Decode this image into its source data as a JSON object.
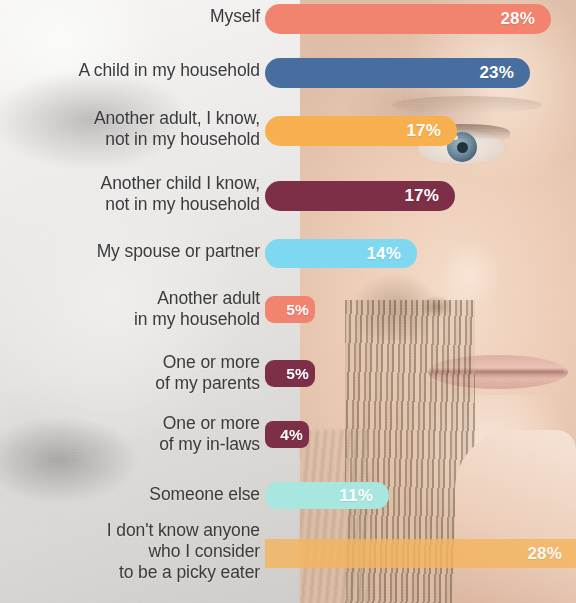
{
  "colors": {
    "coral": "#F2836E",
    "steel_blue": "#476E9E",
    "amber": "#F8B04E",
    "maroon": "#7D2F48",
    "sky_blue": "#7DD8F0",
    "mint": "#A8E6E0",
    "amber_translucent": "#F5B55E",
    "label_text": "#3A3A3C",
    "value_text": "#FFFFFF"
  },
  "chart_data": {
    "type": "bar",
    "orientation": "horizontal",
    "title": "",
    "xlabel": "",
    "ylabel": "",
    "xlim": [
      0,
      30
    ],
    "grid": false,
    "legend": false,
    "value_suffix": "%",
    "categories": [
      "Myself",
      "A child in my household",
      "Another adult, I know,\nnot in my household",
      "Another child I know,\nnot in my household",
      "My spouse or partner",
      "Another adult\nin my household",
      "One or more\nof my parents",
      "One or more\nof my in-laws",
      "Someone else",
      "I don't know anyone\nwho I consider\nto be a picky eater"
    ],
    "values": [
      28,
      23,
      17,
      17,
      14,
      5,
      5,
      4,
      11,
      28
    ],
    "labels": [
      "28%",
      "23%",
      "17%",
      "17%",
      "14%",
      "5%",
      "5%",
      "4%",
      "11%",
      "28%"
    ],
    "bar_colors": [
      "#F2836E",
      "#476E9E",
      "#F8B04E",
      "#7D2F48",
      "#7DD8F0",
      "#F2836E",
      "#7D2F48",
      "#7D2F48",
      "#A8E6E0",
      "#F5B55E"
    ]
  },
  "bars": [
    {
      "label": "Myself",
      "value": "28%",
      "color": "#F2836E",
      "top": 4,
      "height": 30,
      "width": 286,
      "radius": 15,
      "size": "normal",
      "opacity": 1
    },
    {
      "label": "A child in my household",
      "value": "23%",
      "color": "#476E9E",
      "top": 58,
      "height": 30,
      "width": 265,
      "radius": 15,
      "size": "normal",
      "opacity": 1
    },
    {
      "label": "Another adult, I know,\nnot in my household",
      "value": "17%",
      "color": "#F8B04E",
      "top": 116,
      "height": 30,
      "width": 192,
      "radius": 15,
      "size": "normal",
      "opacity": 1
    },
    {
      "label": "Another child I know,\nnot in my household",
      "value": "17%",
      "color": "#7D2F48",
      "top": 181,
      "height": 30,
      "width": 190,
      "radius": 15,
      "size": "normal",
      "opacity": 1
    },
    {
      "label": "My spouse or partner",
      "value": "14%",
      "color": "#7DD8F0",
      "top": 239,
      "height": 29,
      "width": 152,
      "radius": 14,
      "size": "normal",
      "opacity": 1
    },
    {
      "label": "Another adult\nin my household",
      "value": "5%",
      "color": "#F2836E",
      "top": 296,
      "height": 27,
      "width": 50,
      "radius": 9,
      "size": "small",
      "opacity": 1
    },
    {
      "label": "One or more\nof my parents",
      "value": "5%",
      "color": "#7D2F48",
      "top": 360,
      "height": 27,
      "width": 50,
      "radius": 9,
      "size": "small",
      "opacity": 1
    },
    {
      "label": "One or more\nof my in-laws",
      "value": "4%",
      "color": "#7D2F48",
      "top": 421,
      "height": 27,
      "width": 44,
      "radius": 8,
      "size": "small",
      "opacity": 1
    },
    {
      "label": "Someone else",
      "value": "11%",
      "color": "#A8E6E0",
      "top": 482,
      "height": 27,
      "width": 124,
      "radius": 13,
      "size": "normal",
      "opacity": 1
    },
    {
      "label": "I don't know anyone\nwho I consider\nto be a picky eater",
      "value": "28%",
      "color": "#F5B55E",
      "top": 539,
      "height": 29,
      "width": 311,
      "radius": 0,
      "size": "edge",
      "opacity": 0.82
    }
  ],
  "label_positions": [
    {
      "top": 6
    },
    {
      "top": 60
    },
    {
      "top": 108
    },
    {
      "top": 173
    },
    {
      "top": 241
    },
    {
      "top": 288
    },
    {
      "top": 352
    },
    {
      "top": 413
    },
    {
      "top": 484
    },
    {
      "top": 520
    }
  ]
}
